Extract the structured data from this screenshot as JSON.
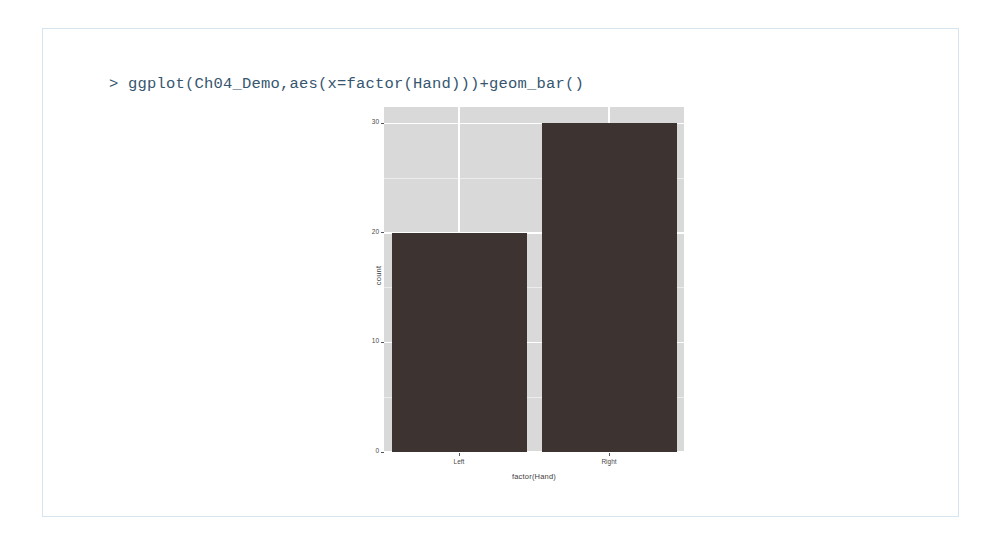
{
  "console": {
    "prompt": "> ",
    "command": "ggplot(Ch04_Demo,aes(x=factor(Hand)))+geom_bar()",
    "text_color": "#36566f",
    "border_color": "#d6e4ef"
  },
  "chart_data": {
    "type": "bar",
    "categories": [
      "Left",
      "Right"
    ],
    "values": [
      20,
      30
    ],
    "title": "",
    "subtitle": "",
    "xlabel": "factor(Hand)",
    "ylabel": "count",
    "ylim": [
      0,
      31.5
    ],
    "yticks": [
      0,
      10,
      20,
      30
    ],
    "ytick_labels": [
      "0",
      "10",
      "20",
      "30"
    ],
    "yminor": [
      5,
      15,
      25
    ],
    "grid": true,
    "legend": "none",
    "panel_background": "#d9d9d9",
    "grid_color": "#ffffff",
    "bar_color": "#3d3330",
    "series": [
      {
        "name": "count",
        "values": [
          20,
          30
        ]
      }
    ]
  }
}
